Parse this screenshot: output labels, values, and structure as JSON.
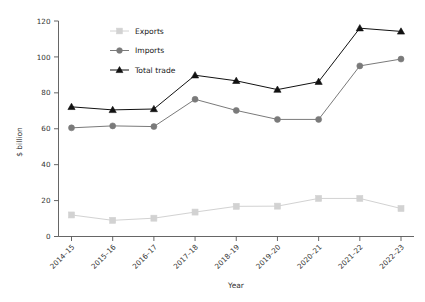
{
  "chart_data": {
    "type": "line",
    "title": "",
    "xlabel": "Year",
    "ylabel": "$ billion",
    "categories": [
      "2014–15",
      "2015–16",
      "2016–17",
      "2017–18",
      "2018–19",
      "2019–20",
      "2020–21",
      "2021–22",
      "2022–23"
    ],
    "ylim": [
      0,
      120
    ],
    "yticks": [
      0,
      20,
      40,
      60,
      80,
      100,
      120
    ],
    "ytick_labels": [
      "0",
      "20",
      "40",
      "60",
      "80",
      "100",
      "120"
    ],
    "grid": false,
    "legend_position": "upper left",
    "series": [
      {
        "name": "Exports",
        "color": "#d2d2d2",
        "marker": "square",
        "values": [
          12.0,
          9.0,
          10.2,
          13.6,
          16.8,
          16.9,
          21.2,
          21.2,
          15.6
        ]
      },
      {
        "name": "Imports",
        "color": "#7a7a7a",
        "marker": "circle",
        "values": [
          60.5,
          61.6,
          61.2,
          76.4,
          70.2,
          65.2,
          65.2,
          95.0,
          98.8
        ]
      },
      {
        "name": "Total trade",
        "color": "#111111",
        "marker": "triangle",
        "values": [
          72.2,
          70.5,
          71.0,
          89.8,
          86.7,
          81.8,
          86.2,
          116.0,
          114.2
        ]
      }
    ]
  },
  "legend": {
    "items": [
      {
        "label": "Exports"
      },
      {
        "label": "Imports"
      },
      {
        "label": "Total trade"
      }
    ]
  },
  "axes": {
    "y_title": "$ billion",
    "x_title": "Year"
  }
}
